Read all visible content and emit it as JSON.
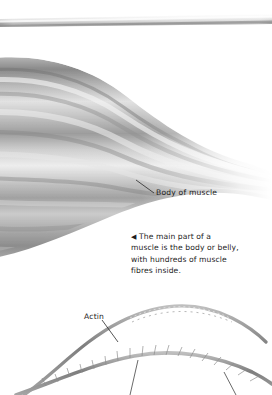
{
  "page": {
    "background_color": "#ffffff",
    "width": 272,
    "height": 395,
    "style": "grayscale airbrush anatomical illustration with handwritten-style annotation labels"
  },
  "figure_top": {
    "name": "tendon-rod",
    "description": "thin tapering pale-grey tendon / rod spanning the full width near the top edge",
    "color_light": "#f2f2f2",
    "color_dark": "#9a9a9a"
  },
  "figure_muscle": {
    "name": "muscle-belly",
    "description": "large grey striated muscle belly, thick at the left, tapering and fading to white toward the right",
    "color_darkest": "#6f6f6f",
    "color_mid": "#a8a8a8",
    "color_light": "#e8e8e8",
    "color_highlight": "#f7f7f7",
    "fibre_count": 9
  },
  "figure_filaments": {
    "name": "muscle-filaments",
    "actin": {
      "label": "Actin",
      "description": "arcing beaded actin filament strand",
      "color": "#8d8d8d"
    },
    "myosin": {
      "description": "lower thick filament with projecting myosin head bristles, leader lines running off the bottom edge",
      "color": "#8d8d8d"
    }
  },
  "labels": {
    "body_of_muscle": "Body of muscle",
    "actin": "Actin"
  },
  "caption": {
    "marker": "◀",
    "lines": [
      "The main part of a",
      "muscle is the body or belly,",
      "with hundreds of muscle",
      "fibres inside."
    ],
    "full_text": "◀ The main part of a muscle is the body or belly, with hundreds of muscle fibres inside.",
    "text_color": "#1d1d1d"
  }
}
